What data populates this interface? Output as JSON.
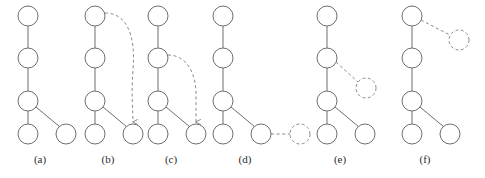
{
  "figure": {
    "width": 485,
    "height": 178,
    "background": "#ffffff",
    "node_radius": 10,
    "ghost_node_radius": 10,
    "colors": {
      "node_stroke": "#6e6e6e",
      "node_fill": "#ffffff",
      "ghost_stroke": "#8a8a8a",
      "edge": "#6e6e6e",
      "dashed_edge": "#8a8a8a",
      "label_text": "#2b2b2b"
    },
    "panels": [
      {
        "id": "a",
        "label": "(a)",
        "label_x": 40,
        "label_y": 163,
        "nodes": [
          {
            "name": "root",
            "x": 28,
            "y": 16,
            "style": "solid"
          },
          {
            "name": "level2",
            "x": 28,
            "y": 58,
            "style": "solid"
          },
          {
            "name": "level3",
            "x": 28,
            "y": 101,
            "style": "solid"
          },
          {
            "name": "leaf-left",
            "x": 28,
            "y": 134,
            "style": "solid"
          },
          {
            "name": "leaf-right",
            "x": 66,
            "y": 134,
            "style": "solid"
          }
        ],
        "edges": [
          {
            "name": "root-to-level2",
            "from": [
              28,
              26
            ],
            "to": [
              28,
              48
            ],
            "style": "solid"
          },
          {
            "name": "level2-to-level3",
            "from": [
              28,
              68
            ],
            "to": [
              28,
              91
            ],
            "style": "solid"
          },
          {
            "name": "level3-to-leaf-left",
            "from": [
              28,
              111
            ],
            "to": [
              28,
              124
            ],
            "style": "solid"
          },
          {
            "name": "level3-to-leaf-right",
            "from": [
              36,
              107
            ],
            "to": [
              60,
              127
            ],
            "style": "solid"
          }
        ],
        "curves": [],
        "arrows": []
      },
      {
        "id": "b",
        "label": "(b)",
        "label_x": 108,
        "label_y": 163,
        "nodes": [
          {
            "name": "root",
            "x": 95,
            "y": 16,
            "style": "solid"
          },
          {
            "name": "level2",
            "x": 95,
            "y": 58,
            "style": "solid"
          },
          {
            "name": "level3",
            "x": 95,
            "y": 101,
            "style": "solid"
          },
          {
            "name": "leaf-left",
            "x": 95,
            "y": 134,
            "style": "solid"
          },
          {
            "name": "leaf-right",
            "x": 133,
            "y": 134,
            "style": "solid"
          }
        ],
        "edges": [
          {
            "name": "root-to-level2",
            "from": [
              95,
              26
            ],
            "to": [
              95,
              48
            ],
            "style": "solid"
          },
          {
            "name": "level2-to-level3",
            "from": [
              95,
              68
            ],
            "to": [
              95,
              91
            ],
            "style": "solid"
          },
          {
            "name": "level3-to-leaf-left",
            "from": [
              95,
              111
            ],
            "to": [
              95,
              124
            ],
            "style": "solid"
          },
          {
            "name": "level3-to-leaf-right",
            "from": [
              103,
              107
            ],
            "to": [
              127,
              127
            ],
            "style": "solid"
          }
        ],
        "curves": [
          {
            "name": "move-root-to-leaf-right",
            "path": "M 105 13 C 126 13 136 34 133 70 C 131 98 133 110 133 122",
            "style": "dashed",
            "arrow_at": [
              133,
              124
            ],
            "arrow_dir": "down"
          }
        ]
      },
      {
        "id": "c",
        "label": "(c)",
        "label_x": 171,
        "label_y": 163,
        "nodes": [
          {
            "name": "root",
            "x": 158,
            "y": 16,
            "style": "solid"
          },
          {
            "name": "level2",
            "x": 158,
            "y": 58,
            "style": "solid"
          },
          {
            "name": "level3",
            "x": 158,
            "y": 101,
            "style": "solid"
          },
          {
            "name": "leaf-left",
            "x": 158,
            "y": 134,
            "style": "solid"
          },
          {
            "name": "leaf-right",
            "x": 196,
            "y": 134,
            "style": "solid"
          }
        ],
        "edges": [
          {
            "name": "root-to-level2",
            "from": [
              158,
              26
            ],
            "to": [
              158,
              48
            ],
            "style": "solid"
          },
          {
            "name": "level2-to-level3",
            "from": [
              158,
              68
            ],
            "to": [
              158,
              91
            ],
            "style": "solid"
          },
          {
            "name": "level3-to-leaf-left",
            "from": [
              158,
              111
            ],
            "to": [
              158,
              124
            ],
            "style": "solid"
          },
          {
            "name": "level3-to-leaf-right",
            "from": [
              166,
              107
            ],
            "to": [
              190,
              127
            ],
            "style": "solid"
          }
        ],
        "curves": [
          {
            "name": "move-level2-to-leaf-right",
            "path": "M 168 55 C 188 55 197 76 196 98 C 196 112 196 116 196 122",
            "style": "dashed",
            "arrow_at": [
              196,
              124
            ],
            "arrow_dir": "down"
          }
        ]
      },
      {
        "id": "d",
        "label": "(d)",
        "label_x": 245,
        "label_y": 163,
        "nodes": [
          {
            "name": "root",
            "x": 223,
            "y": 16,
            "style": "solid"
          },
          {
            "name": "level2",
            "x": 223,
            "y": 58,
            "style": "solid"
          },
          {
            "name": "level3",
            "x": 223,
            "y": 101,
            "style": "solid"
          },
          {
            "name": "leaf-left",
            "x": 223,
            "y": 134,
            "style": "solid"
          },
          {
            "name": "leaf-middle",
            "x": 261,
            "y": 134,
            "style": "solid"
          },
          {
            "name": "leaf-ghost-right",
            "x": 300,
            "y": 134,
            "style": "ghost"
          }
        ],
        "edges": [
          {
            "name": "root-to-level2",
            "from": [
              223,
              26
            ],
            "to": [
              223,
              48
            ],
            "style": "solid"
          },
          {
            "name": "level2-to-level3",
            "from": [
              223,
              68
            ],
            "to": [
              223,
              91
            ],
            "style": "solid"
          },
          {
            "name": "level3-to-leaf-left",
            "from": [
              223,
              111
            ],
            "to": [
              223,
              124
            ],
            "style": "solid"
          },
          {
            "name": "level3-to-leaf-middle",
            "from": [
              231,
              107
            ],
            "to": [
              255,
              127
            ],
            "style": "solid"
          },
          {
            "name": "leaf-middle-to-ghost",
            "from": [
              271,
              134
            ],
            "to": [
              290,
              134
            ],
            "style": "dashed"
          }
        ],
        "curves": []
      },
      {
        "id": "e",
        "label": "(e)",
        "label_x": 340,
        "label_y": 163,
        "nodes": [
          {
            "name": "root",
            "x": 327,
            "y": 16,
            "style": "solid"
          },
          {
            "name": "level2",
            "x": 327,
            "y": 58,
            "style": "solid"
          },
          {
            "name": "level3",
            "x": 327,
            "y": 101,
            "style": "solid"
          },
          {
            "name": "leaf-left",
            "x": 327,
            "y": 134,
            "style": "solid"
          },
          {
            "name": "leaf-right",
            "x": 365,
            "y": 134,
            "style": "solid"
          },
          {
            "name": "ghost-branch",
            "x": 366,
            "y": 88,
            "style": "ghost"
          }
        ],
        "edges": [
          {
            "name": "root-to-level2",
            "from": [
              327,
              26
            ],
            "to": [
              327,
              48
            ],
            "style": "solid"
          },
          {
            "name": "level2-to-level3",
            "from": [
              327,
              68
            ],
            "to": [
              327,
              91
            ],
            "style": "solid"
          },
          {
            "name": "level3-to-leaf-left",
            "from": [
              327,
              111
            ],
            "to": [
              327,
              124
            ],
            "style": "solid"
          },
          {
            "name": "level3-to-leaf-right",
            "from": [
              335,
              107
            ],
            "to": [
              359,
              127
            ],
            "style": "solid"
          },
          {
            "name": "level2-to-ghost-branch",
            "from": [
              336,
              62
            ],
            "to": [
              358,
              82
            ],
            "style": "dashed"
          }
        ],
        "curves": []
      },
      {
        "id": "f",
        "label": "(f)",
        "label_x": 425,
        "label_y": 163,
        "nodes": [
          {
            "name": "root",
            "x": 412,
            "y": 16,
            "style": "solid"
          },
          {
            "name": "level2",
            "x": 412,
            "y": 58,
            "style": "solid"
          },
          {
            "name": "level3",
            "x": 412,
            "y": 101,
            "style": "solid"
          },
          {
            "name": "leaf-left",
            "x": 412,
            "y": 134,
            "style": "solid"
          },
          {
            "name": "leaf-right",
            "x": 450,
            "y": 134,
            "style": "solid"
          },
          {
            "name": "ghost-branch",
            "x": 459,
            "y": 40,
            "style": "ghost"
          }
        ],
        "edges": [
          {
            "name": "root-to-level2",
            "from": [
              412,
              26
            ],
            "to": [
              412,
              48
            ],
            "style": "solid"
          },
          {
            "name": "level2-to-level3",
            "from": [
              412,
              68
            ],
            "to": [
              412,
              91
            ],
            "style": "solid"
          },
          {
            "name": "level3-to-leaf-left",
            "from": [
              412,
              111
            ],
            "to": [
              412,
              124
            ],
            "style": "solid"
          },
          {
            "name": "level3-to-leaf-right",
            "from": [
              420,
              107
            ],
            "to": [
              444,
              127
            ],
            "style": "solid"
          },
          {
            "name": "root-to-ghost-branch",
            "from": [
              421,
              20
            ],
            "to": [
              450,
              35
            ],
            "style": "dashed"
          }
        ],
        "curves": []
      }
    ]
  }
}
